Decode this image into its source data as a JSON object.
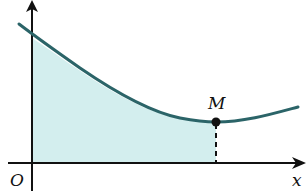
{
  "diagram": {
    "type": "function-graph-shaded-area",
    "labels": {
      "origin": "O",
      "x_axis": "x",
      "y_axis": "y",
      "point": "M"
    },
    "colors": {
      "curve": "#2b6468",
      "fill": "#d3eeee",
      "axes": "#111111"
    }
  }
}
